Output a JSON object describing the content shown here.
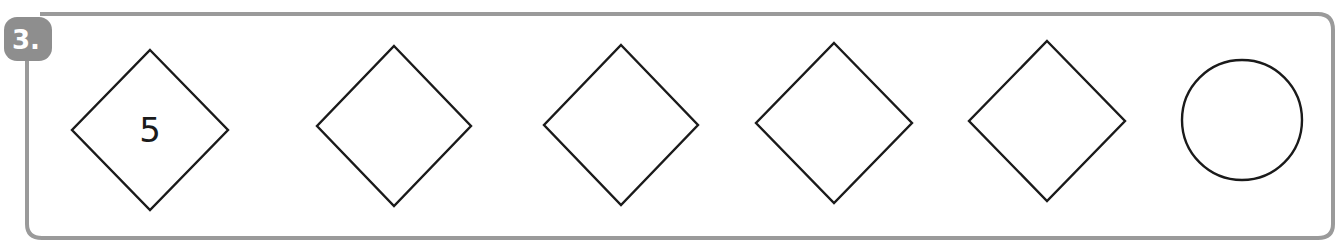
{
  "exercise": {
    "number_label": "3.",
    "frame_color": "#9a9a9a",
    "stroke_color": "#1a1a1a"
  },
  "shapes": [
    {
      "type": "diamond",
      "value": "5",
      "cx": 150,
      "cy": 130,
      "rx": 78,
      "ry": 80
    },
    {
      "type": "diamond",
      "value": "",
      "cx": 394,
      "cy": 126,
      "rx": 77,
      "ry": 80
    },
    {
      "type": "diamond",
      "value": "",
      "cx": 621,
      "cy": 125,
      "rx": 77,
      "ry": 80
    },
    {
      "type": "diamond",
      "value": "",
      "cx": 834,
      "cy": 123,
      "rx": 78,
      "ry": 80
    },
    {
      "type": "diamond",
      "value": "",
      "cx": 1047,
      "cy": 121,
      "rx": 78,
      "ry": 80
    },
    {
      "type": "circle",
      "value": "",
      "cx": 1242,
      "cy": 120,
      "r": 60
    }
  ]
}
